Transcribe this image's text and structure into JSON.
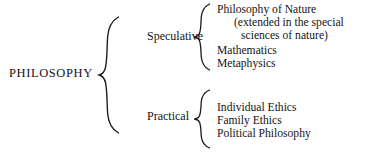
{
  "diagram": {
    "title": "PHILOSOPHY",
    "root": {
      "label": "PHILOSOPHY",
      "name": "philosophy-root"
    },
    "brace_icon_name": "curly-brace-icon",
    "branches": [
      {
        "label": "Speculative",
        "leaves": [
          {
            "text": "Philosophy of Nature",
            "indent": 0
          },
          {
            "text": "(extended in the special",
            "indent": 1
          },
          {
            "text": "sciences of nature)",
            "indent": 2
          },
          {
            "text": "Mathematics",
            "indent": 0
          },
          {
            "text": "Metaphysics",
            "indent": 0
          }
        ]
      },
      {
        "label": "Practical",
        "leaves": [
          {
            "text": "Individual Ethics",
            "indent": 0
          },
          {
            "text": "Family Ethics",
            "indent": 0
          },
          {
            "text": "Political Philosophy",
            "indent": 0
          }
        ]
      }
    ],
    "colors": {
      "background": "#ffffff",
      "ink": "#1a1a1a"
    }
  }
}
